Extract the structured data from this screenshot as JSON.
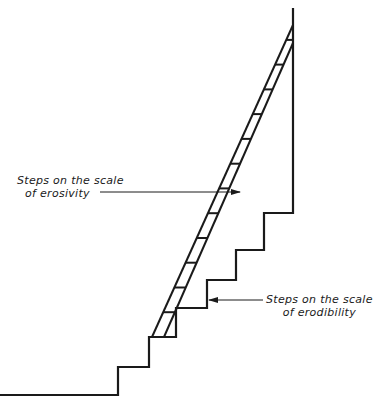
{
  "diagram": {
    "type": "staircase-ladder",
    "labels": {
      "erosivity": {
        "line1": "Steps on the scale",
        "line2": "of erosivity"
      },
      "erodibility": {
        "line1": "Steps on the scale",
        "line2": "of erodibility"
      }
    },
    "colors": {
      "stroke": "#1a1a1a",
      "background": "#ffffff"
    },
    "ladder_rungs": 12,
    "erodibility_steps": 4
  }
}
